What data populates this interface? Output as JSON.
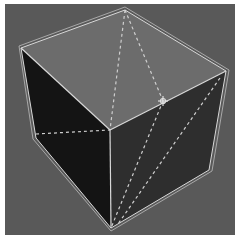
{
  "scene": {
    "description": "Wireframe-selected 3D cube in a dark gray viewport with dashed diagonal edges",
    "colors": {
      "frame": "#ffffff",
      "background": "#595959",
      "top_face": "#6c6c6c",
      "left_face": "#141414",
      "right_face": "#2e2e2e",
      "edge": "#d8d8d8",
      "dashed_edge": "#cfcfcf"
    },
    "vertices": {
      "top_back": [
        125,
        10
      ],
      "top_left": [
        21,
        48
      ],
      "top_right": [
        226,
        71
      ],
      "top_front": [
        110,
        130
      ],
      "bottom_left": [
        36,
        138
      ],
      "bottom_right": [
        209,
        170
      ],
      "bottom_front": [
        111,
        228
      ]
    },
    "marker": {
      "name": "vertex-marker",
      "position": [
        163,
        101
      ]
    }
  }
}
